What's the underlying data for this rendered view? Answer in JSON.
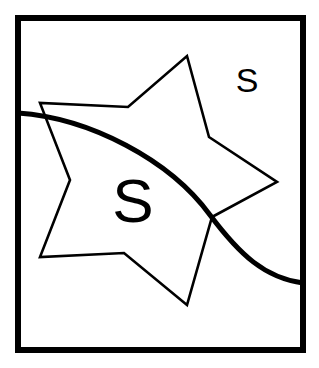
{
  "canvas": {
    "width": 319,
    "height": 368,
    "background_color": "#ffffff",
    "ink_color": "#000000"
  },
  "frame": {
    "name": "outer-rectangle-border",
    "x": 18,
    "y": 18,
    "width": 285,
    "height": 332,
    "stroke_width": 6,
    "stroke_color": "#000000",
    "fill": "none"
  },
  "star": {
    "name": "five-pointed-star-outline",
    "stroke_width": 2.6,
    "stroke_color": "#000000",
    "fill": "none",
    "points": "187,56 209,137 277,182 212,217 187,305 124,253 40,257 70,180 40,103 128,107",
    "vertices": [
      {
        "label": "top-point",
        "x": 187,
        "y": 56
      },
      {
        "label": "upper-right-notch",
        "x": 209,
        "y": 137
      },
      {
        "label": "right-point",
        "x": 277,
        "y": 182
      },
      {
        "label": "lower-right-notch",
        "x": 212,
        "y": 217
      },
      {
        "label": "bottom-point",
        "x": 187,
        "y": 305
      },
      {
        "label": "bottom-notch",
        "x": 124,
        "y": 253
      },
      {
        "label": "lower-left-point",
        "x": 40,
        "y": 257
      },
      {
        "label": "left-notch",
        "x": 70,
        "y": 180
      },
      {
        "label": "upper-left-point",
        "x": 40,
        "y": 103
      },
      {
        "label": "upper-notch",
        "x": 128,
        "y": 107
      }
    ]
  },
  "curve": {
    "name": "sweeping-arc-curve",
    "stroke_width": 5,
    "stroke_color": "#000000",
    "fill": "none",
    "path": "M 18 113 C 90 118, 170 160, 210 215 C 240 255, 265 278, 303 283",
    "entry_point": {
      "x": 18,
      "y": 113
    },
    "exit_point": {
      "x": 303,
      "y": 283
    }
  },
  "labels": {
    "large_letter": {
      "name": "large-s-letter",
      "text": "S",
      "x": 133,
      "y": 222,
      "font_size": 62,
      "color": "#000000"
    },
    "small_letter": {
      "name": "small-s-letter",
      "text": "S",
      "x": 247,
      "y": 92,
      "font_size": 34,
      "color": "#000000"
    }
  }
}
